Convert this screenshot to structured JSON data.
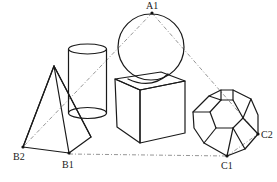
{
  "figure": {
    "type": "geometry-solids-diagram",
    "solids": [
      "pyramid",
      "cylinder",
      "sphere",
      "cube",
      "dodecahedron"
    ],
    "points": {
      "A1": {
        "label": "A1",
        "x": 152,
        "y": 13
      },
      "B1": {
        "label": "B1",
        "x": 69,
        "y": 153
      },
      "B2": {
        "label": "B2",
        "x": 23,
        "y": 147
      },
      "C1": {
        "label": "C1",
        "x": 227,
        "y": 156
      },
      "C2": {
        "label": "C2",
        "x": 258,
        "y": 134
      }
    },
    "dashed_lines": [
      [
        "A1",
        "B2"
      ],
      [
        "A1",
        "C2"
      ],
      [
        "B1",
        "C1"
      ],
      [
        "C1",
        "C2"
      ]
    ],
    "colors": {
      "stroke": "#1a1a1a",
      "dashed": "#8a8a8a",
      "background": "#ffffff"
    }
  }
}
